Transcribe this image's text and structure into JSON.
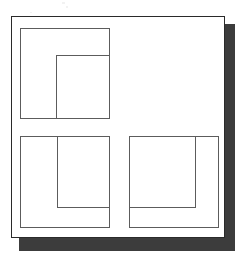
{
  "document": {
    "type": "line-drawing",
    "description": "Scanned diagram of a sheet with drop shadow containing three outlined rectangular frames, each holding a nested inner rectangle anchored to a different corner",
    "canvas": {
      "width": 246,
      "height": 265,
      "background": "#ffffff"
    }
  },
  "colors": {
    "page_fill": "#ffffff",
    "page_border": "#2a2a2a",
    "shadow": "#3c3c3c",
    "line": "#5c5c5c",
    "speckle": "#f2f2f2"
  },
  "sheet": {
    "label": "sheet",
    "x": 11,
    "y": 16,
    "width": 214,
    "height": 222
  },
  "shadow": {
    "label": "sheet-drop-shadow",
    "x": 19,
    "y": 24,
    "width": 216,
    "height": 227
  },
  "speckles": [
    {
      "x": 62,
      "y": 2,
      "width": 3,
      "height": 2
    },
    {
      "x": 66,
      "y": 6,
      "width": 2,
      "height": 2
    },
    {
      "x": 30,
      "y": 12,
      "width": 2,
      "height": 1
    }
  ],
  "frames": [
    {
      "id": "frame-top-left",
      "label": "Top-left frame",
      "x": 20,
      "y": 28,
      "width": 90,
      "height": 91,
      "inner": {
        "id": "inner-rect-top-left",
        "label": "Inner rectangle anchored bottom-right",
        "anchor": "bottom-right",
        "x": 56,
        "y": 55,
        "width": 54,
        "height": 64
      }
    },
    {
      "id": "frame-bottom-left",
      "label": "Bottom-left frame",
      "x": 20,
      "y": 136,
      "width": 90,
      "height": 92,
      "inner": {
        "id": "inner-rect-bottom-left",
        "label": "Inner rectangle anchored top-right",
        "anchor": "top-right",
        "x": 57,
        "y": 136,
        "width": 53,
        "height": 72
      }
    },
    {
      "id": "frame-bottom-right",
      "label": "Bottom-right frame",
      "x": 129,
      "y": 136,
      "width": 90,
      "height": 92,
      "inner": {
        "id": "inner-rect-bottom-right",
        "label": "Inner rectangle anchored top-left",
        "anchor": "top-left",
        "x": 129,
        "y": 136,
        "width": 67,
        "height": 72
      }
    }
  ]
}
